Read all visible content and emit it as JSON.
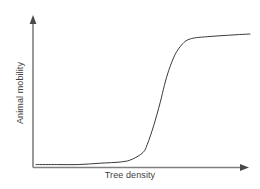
{
  "figure": {
    "width": 260,
    "height": 189,
    "background_color": "#ffffff"
  },
  "axes": {
    "line_color": "#808080",
    "arrow_color": "#4a4a4a",
    "origin": {
      "x": 33,
      "y": 167
    },
    "x_axis_end": {
      "x": 247,
      "y": 167
    },
    "y_axis_end": {
      "x": 33,
      "y": 18
    },
    "has_x_arrow": true,
    "has_y_arrow": true,
    "has_ticks": false,
    "has_grid": false,
    "has_tick_labels": false
  },
  "labels": {
    "x_label": "Tree density",
    "y_label": "Animal mobility",
    "text_color": "#3d3d3d",
    "font_size_px": 9,
    "y_label_rotation_deg": -90
  },
  "chart_data": {
    "type": "line",
    "title": "",
    "xlabel": "Tree density",
    "ylabel": "Animal mobility",
    "grid": false,
    "legend": false,
    "xlim": [
      0,
      1
    ],
    "ylim": [
      0,
      1
    ],
    "axis_tick_labels": {
      "x": [],
      "y": []
    },
    "series": [
      {
        "name": "Animal mobility vs tree density",
        "color": "#3a3a3a",
        "line_width": 1,
        "shape": "sigmoid",
        "description": "Flat near zero at low tree density, steep sigmoidal increase at intermediate tree density, then saturating plateau at high tree density",
        "x": [
          0.0,
          0.1,
          0.2,
          0.3,
          0.4,
          0.45,
          0.5,
          0.52,
          0.55,
          0.58,
          0.6,
          0.62,
          0.65,
          0.68,
          0.7,
          0.72,
          0.75,
          0.8,
          0.85,
          0.9,
          0.95,
          1.0
        ],
        "y": [
          0.01,
          0.01,
          0.01,
          0.02,
          0.03,
          0.05,
          0.1,
          0.16,
          0.3,
          0.47,
          0.6,
          0.71,
          0.83,
          0.9,
          0.93,
          0.945,
          0.955,
          0.962,
          0.968,
          0.973,
          0.978,
          0.982
        ]
      }
    ],
    "annotations": []
  }
}
